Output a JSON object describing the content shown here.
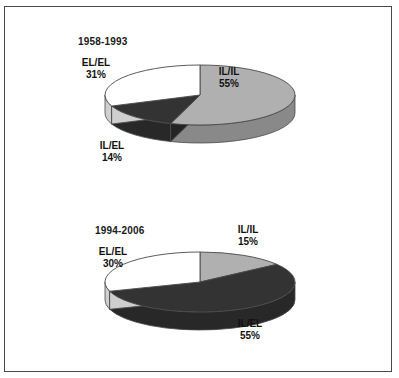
{
  "figure": {
    "background_color": "#ffffff",
    "frame_color": "#4a4a4a"
  },
  "palette": {
    "slice_light_gray": "#b0b0b0",
    "slice_light_gray_side": "#8f8f8f",
    "slice_dark": "#333333",
    "slice_dark_side": "#262626",
    "slice_white": "#ffffff",
    "slice_white_side": "#cfcfcf",
    "outline": "#4a4a4a",
    "text": "#111111"
  },
  "chart_data": [
    {
      "type": "pie",
      "id": "chart-1958-1993",
      "title": "1958-1993",
      "categories": [
        "IL/IL",
        "IL/EL",
        "EL/EL"
      ],
      "values": [
        55,
        14,
        31
      ],
      "labels": [
        "55%",
        "14%",
        "31%"
      ],
      "colors": [
        "#b0b0b0",
        "#333333",
        "#ffffff"
      ],
      "start_angle_deg": 0,
      "direction": "clockwise",
      "three_d": true,
      "legend": "none",
      "grid": false
    },
    {
      "type": "pie",
      "id": "chart-1994-2006",
      "title": "1994-2006",
      "categories": [
        "IL/IL",
        "IL/EL",
        "EL/EL"
      ],
      "values": [
        15,
        55,
        30
      ],
      "labels": [
        "15%",
        "55%",
        "30%"
      ],
      "colors": [
        "#b0b0b0",
        "#333333",
        "#ffffff"
      ],
      "start_angle_deg": 0,
      "direction": "clockwise",
      "three_d": true,
      "legend": "none",
      "grid": false
    }
  ],
  "chart1": {
    "title": "1958-1993",
    "slices": {
      "ilil": {
        "name": "IL/IL",
        "pct": "55%"
      },
      "ilel": {
        "name": "IL/EL",
        "pct": "14%"
      },
      "elel": {
        "name": "EL/EL",
        "pct": "31%"
      }
    }
  },
  "chart2": {
    "title": "1994-2006",
    "slices": {
      "ilil": {
        "name": "IL/IL",
        "pct": "15%"
      },
      "ilel": {
        "name": "IL/EL",
        "pct": "55%"
      },
      "elel": {
        "name": "EL/EL",
        "pct": "30%"
      }
    }
  }
}
